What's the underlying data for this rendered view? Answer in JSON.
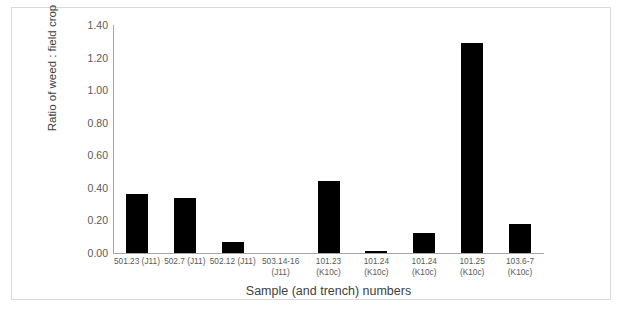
{
  "chart_data": {
    "type": "bar",
    "title": "",
    "xlabel": "Sample (and trench) numbers",
    "ylabel": "Ratio of weed : field crop",
    "ylim": [
      0.0,
      1.4
    ],
    "ytick_step": 0.2,
    "ytick_labels": [
      "0.00",
      "0.20",
      "0.40",
      "0.60",
      "0.80",
      "1.00",
      "1.20",
      "1.40"
    ],
    "ytick_values": [
      0.0,
      0.2,
      0.4,
      0.6,
      0.8,
      1.0,
      1.2,
      1.4
    ],
    "grid": false,
    "legend": false,
    "bar_color": "#000000",
    "axis_color": "#a6a6a6",
    "categories": [
      "501.23 (J11)",
      "502.7 (J11)",
      "502.12 (J11)",
      "503.14-16 (J11)",
      "101.23 (K10c)",
      "101.24 (K10c)",
      "101.24 (K10c)",
      "101.25 (K10c)",
      "103.6-7 (K10c)"
    ],
    "category_lines": [
      [
        "501.23 (J11)"
      ],
      [
        "502.7 (J11)"
      ],
      [
        "502.12 (J11)"
      ],
      [
        "503.14-16",
        "(J11)"
      ],
      [
        "101.23",
        "(K10c)"
      ],
      [
        "101.24",
        "(K10c)"
      ],
      [
        "101.24",
        "(K10c)"
      ],
      [
        "101.25",
        "(K10c)"
      ],
      [
        "103.6-7",
        "(K10c)"
      ]
    ],
    "values": [
      0.36,
      0.34,
      0.07,
      0.0,
      0.44,
      0.01,
      0.12,
      1.29,
      0.18
    ]
  }
}
